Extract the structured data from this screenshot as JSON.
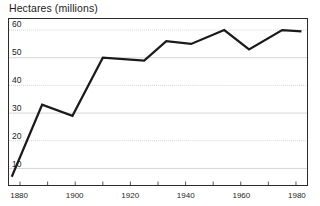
{
  "chart_data": {
    "type": "line",
    "title": "Hectares (millions)",
    "xlabel": "",
    "ylabel": "Hectares (millions)",
    "xlim": [
      1876,
      1984
    ],
    "ylim": [
      4,
      64
    ],
    "grid": true,
    "legend": "none",
    "y_ticks": [
      10,
      20,
      30,
      40,
      50,
      60
    ],
    "y_tick_labels": [
      "10",
      "20",
      "30",
      "40",
      "50",
      "60"
    ],
    "x_ticks": [
      1880,
      1890,
      1900,
      1910,
      1920,
      1930,
      1940,
      1950,
      1960,
      1970,
      1980
    ],
    "x_tick_labels_shown": [
      "1880",
      "1900",
      "1920",
      "1940",
      "1960",
      "1980"
    ],
    "x_labeled_ticks": [
      1880,
      1900,
      1920,
      1940,
      1960,
      1980
    ],
    "series": [
      {
        "name": "Hectares",
        "color": "#1a1a1a",
        "line_width": 2.2,
        "x": [
          1877,
          1888,
          1899,
          1910,
          1925,
          1933,
          1942,
          1954,
          1963,
          1975,
          1982
        ],
        "values": [
          7,
          33,
          29,
          50,
          49,
          56,
          55,
          60,
          53,
          60,
          59.5
        ]
      }
    ]
  },
  "axes": {
    "y_labels": [
      {
        "text": "60",
        "value": 60
      },
      {
        "text": "50",
        "value": 50
      },
      {
        "text": "40",
        "value": 40
      },
      {
        "text": "30",
        "value": 30
      },
      {
        "text": "20",
        "value": 20
      },
      {
        "text": "10",
        "value": 10
      }
    ],
    "x_labels": [
      {
        "text": "1880",
        "value": 1880
      },
      {
        "text": "1900",
        "value": 1900
      },
      {
        "text": "1920",
        "value": 1920
      },
      {
        "text": "1940",
        "value": 1940
      },
      {
        "text": "1960",
        "value": 1960
      },
      {
        "text": "1980",
        "value": 1980
      }
    ]
  },
  "style": {
    "frame_color": "#2b2b2b",
    "grid_color": "#c9c9c9",
    "line_color": "#1a1a1a",
    "background": "#ffffff",
    "text_color": "#1c1c1c"
  }
}
